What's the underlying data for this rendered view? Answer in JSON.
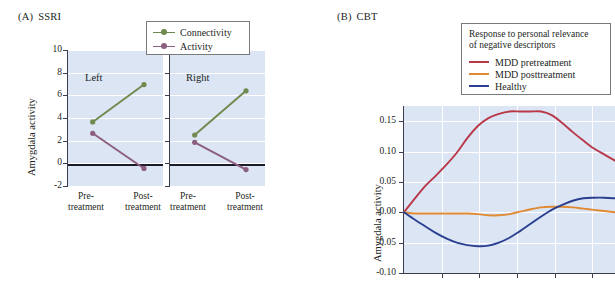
{
  "figure": {
    "panelA": {
      "tag": "(A)",
      "title": "SSRI",
      "ylabel": "Amygdala activity",
      "yticks": [
        "10",
        "8",
        "6",
        "4",
        "2",
        "0",
        "-2"
      ],
      "ylim": [
        -2,
        10
      ],
      "groups": [
        {
          "name": "Left",
          "xcats": [
            "Pre-\ntreatment",
            "Post-\ntreatment"
          ],
          "xcat1_line1": "Pre-",
          "xcat1_line2": "treatment",
          "xcat2_line1": "Post-",
          "xcat2_line2": "treatment"
        },
        {
          "name": "Right",
          "xcat1_line1": "Pre-",
          "xcat1_line2": "treatment",
          "xcat2_line1": "Post-",
          "xcat2_line2": "treatment"
        }
      ],
      "legend": {
        "items": [
          {
            "label": "Connectivity",
            "color": "#6f8a4c"
          },
          {
            "label": "Activity",
            "color": "#8c5e80"
          }
        ]
      }
    },
    "panelB": {
      "tag": "(B)",
      "title": "CBT",
      "ylabel": "Amygdala activity",
      "yticks": [
        "0.15",
        "0.10",
        "0.05",
        "0.00",
        "-0.05",
        "-0.10"
      ],
      "ylim": [
        -0.1,
        0.175
      ],
      "legend": {
        "title_line1": "Response to personal relevance",
        "title_line2": "of negative descriptors",
        "items": [
          {
            "label": "MDD pretreatment",
            "color": "#b93848"
          },
          {
            "label": "MDD posttreatment",
            "color": "#e08a33"
          },
          {
            "label": "Healthy",
            "color": "#2a3f8f"
          }
        ]
      }
    }
  },
  "chart_data": [
    {
      "type": "line",
      "panel": "A",
      "title": "(A) SSRI",
      "xlabel": "",
      "ylabel": "Amygdala activity",
      "ylim": [
        -2,
        10
      ],
      "yticks": [
        10,
        8,
        6,
        4,
        2,
        0,
        -2
      ],
      "grid": true,
      "legend_position": "top-right",
      "subplots": [
        {
          "name": "Left",
          "categories": [
            "Pre-treatment",
            "Post-treatment"
          ],
          "series": [
            {
              "name": "Connectivity",
              "color": "#6f8a4c",
              "values": [
                3.65,
                6.95
              ]
            },
            {
              "name": "Activity",
              "color": "#8c5e80",
              "values": [
                2.65,
                -0.45
              ]
            }
          ]
        },
        {
          "name": "Right",
          "categories": [
            "Pre-treatment",
            "Post-treatment"
          ],
          "series": [
            {
              "name": "Connectivity",
              "color": "#6f8a4c",
              "values": [
                2.5,
                6.4
              ]
            },
            {
              "name": "Activity",
              "color": "#8c5e80",
              "values": [
                1.85,
                -0.55
              ]
            }
          ]
        }
      ]
    },
    {
      "type": "line",
      "panel": "B",
      "title": "(B) CBT",
      "subtitle": "Response to personal relevance of negative descriptors",
      "xlabel": "",
      "ylabel": "Amygdala activity",
      "ylim": [
        -0.1,
        0.175
      ],
      "yticks": [
        0.15,
        0.1,
        0.05,
        0.0,
        -0.05,
        -0.1
      ],
      "grid": true,
      "legend_position": "top-right",
      "x": [
        0,
        0.05,
        0.1,
        0.15,
        0.2,
        0.25,
        0.3,
        0.35,
        0.4,
        0.45,
        0.5,
        0.55,
        0.6,
        0.65,
        0.7,
        0.75,
        0.8,
        0.85,
        0.9,
        0.95,
        1.0
      ],
      "series": [
        {
          "name": "MDD pretreatment",
          "color": "#b93848",
          "values": [
            0.0,
            0.022,
            0.043,
            0.06,
            0.078,
            0.098,
            0.122,
            0.142,
            0.155,
            0.162,
            0.166,
            0.166,
            0.166,
            0.166,
            0.16,
            0.147,
            0.132,
            0.118,
            0.105,
            0.095,
            0.085
          ]
        },
        {
          "name": "MDD posttreatment",
          "color": "#e08a33",
          "values": [
            0.0,
            -0.002,
            -0.002,
            -0.002,
            -0.002,
            -0.002,
            -0.002,
            -0.003,
            -0.005,
            -0.005,
            -0.003,
            0.001,
            0.005,
            0.008,
            0.009,
            0.009,
            0.008,
            0.006,
            0.004,
            0.002,
            0.0
          ]
        },
        {
          "name": "Healthy",
          "color": "#2a3f8f",
          "values": [
            0.0,
            -0.012,
            -0.023,
            -0.034,
            -0.043,
            -0.05,
            -0.054,
            -0.056,
            -0.055,
            -0.05,
            -0.042,
            -0.031,
            -0.019,
            -0.007,
            0.004,
            0.012,
            0.019,
            0.023,
            0.024,
            0.024,
            0.023
          ]
        }
      ]
    }
  ]
}
